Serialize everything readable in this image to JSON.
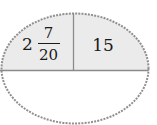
{
  "diagram": {
    "type": "divided-ellipse",
    "colors": {
      "shaded_fill": "#ebebeb",
      "border": "#8f8f8f",
      "divider": "#8a8a8a",
      "text": "#1a1a1a"
    },
    "cells": {
      "top_left": {
        "whole": "2",
        "numerator": "7",
        "denominator": "20"
      },
      "top_right": {
        "value": "15"
      },
      "bottom": {
        "value": ""
      }
    }
  }
}
